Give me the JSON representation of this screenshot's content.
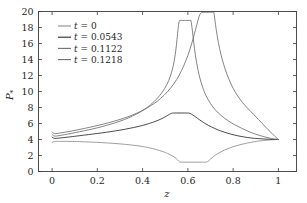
{
  "chart_data": {
    "type": "line",
    "title": "",
    "xlabel": "z",
    "ylabel": "P*",
    "xlim": [
      -0.06,
      1.08
    ],
    "ylim": [
      0,
      20
    ],
    "xticks": [
      "0",
      "0.2",
      "0.4",
      "0.6",
      "0.8",
      "1"
    ],
    "xtick_values": [
      0,
      0.2,
      0.4,
      0.6,
      0.8,
      1.0
    ],
    "yticks": [
      "0",
      "2",
      "4",
      "6",
      "8",
      "10",
      "12",
      "14",
      "16",
      "18",
      "20"
    ],
    "ytick_values": [
      0,
      2,
      4,
      6,
      8,
      10,
      12,
      14,
      16,
      18,
      20
    ],
    "grid": false,
    "legend_position": "upper-left",
    "series": [
      {
        "name": "t = 0",
        "color": "#8c8c8c",
        "points": [
          [
            0.0,
            3.62
          ],
          [
            0.004,
            3.7
          ],
          [
            0.01,
            3.74
          ],
          [
            0.02,
            3.76
          ],
          [
            0.04,
            3.77
          ],
          [
            0.08,
            3.76
          ],
          [
            0.12,
            3.73
          ],
          [
            0.17,
            3.68
          ],
          [
            0.22,
            3.61
          ],
          [
            0.27,
            3.52
          ],
          [
            0.32,
            3.4
          ],
          [
            0.36,
            3.28
          ],
          [
            0.4,
            3.12
          ],
          [
            0.43,
            2.96
          ],
          [
            0.46,
            2.75
          ],
          [
            0.49,
            2.48
          ],
          [
            0.51,
            2.26
          ],
          [
            0.53,
            1.98
          ],
          [
            0.545,
            1.7
          ],
          [
            0.555,
            1.44
          ],
          [
            0.562,
            1.25
          ],
          [
            0.568,
            1.18
          ],
          [
            0.6,
            1.17
          ],
          [
            0.64,
            1.17
          ],
          [
            0.67,
            1.17
          ],
          [
            0.682,
            1.18
          ],
          [
            0.69,
            1.3
          ],
          [
            0.7,
            1.55
          ],
          [
            0.715,
            1.9
          ],
          [
            0.73,
            2.2
          ],
          [
            0.75,
            2.52
          ],
          [
            0.775,
            2.84
          ],
          [
            0.8,
            3.1
          ],
          [
            0.83,
            3.34
          ],
          [
            0.86,
            3.54
          ],
          [
            0.89,
            3.7
          ],
          [
            0.92,
            3.83
          ],
          [
            0.95,
            3.92
          ],
          [
            0.975,
            3.97
          ],
          [
            1.0,
            4.0
          ]
        ]
      },
      {
        "name": "t = 0.0543",
        "color": "#2b2b2b",
        "points": [
          [
            0.0,
            4.3
          ],
          [
            0.005,
            4.2
          ],
          [
            0.012,
            4.14
          ],
          [
            0.025,
            4.16
          ],
          [
            0.045,
            4.22
          ],
          [
            0.07,
            4.3
          ],
          [
            0.1,
            4.4
          ],
          [
            0.14,
            4.54
          ],
          [
            0.18,
            4.68
          ],
          [
            0.22,
            4.83
          ],
          [
            0.26,
            4.99
          ],
          [
            0.3,
            5.17
          ],
          [
            0.34,
            5.38
          ],
          [
            0.38,
            5.62
          ],
          [
            0.415,
            5.88
          ],
          [
            0.445,
            6.15
          ],
          [
            0.47,
            6.42
          ],
          [
            0.49,
            6.68
          ],
          [
            0.505,
            6.92
          ],
          [
            0.518,
            7.14
          ],
          [
            0.528,
            7.27
          ],
          [
            0.535,
            7.31
          ],
          [
            0.57,
            7.31
          ],
          [
            0.6,
            7.31
          ],
          [
            0.605,
            7.3
          ],
          [
            0.615,
            7.18
          ],
          [
            0.628,
            6.95
          ],
          [
            0.642,
            6.66
          ],
          [
            0.66,
            6.3
          ],
          [
            0.68,
            5.94
          ],
          [
            0.705,
            5.56
          ],
          [
            0.73,
            5.24
          ],
          [
            0.76,
            4.93
          ],
          [
            0.79,
            4.67
          ],
          [
            0.82,
            4.47
          ],
          [
            0.85,
            4.31
          ],
          [
            0.88,
            4.19
          ],
          [
            0.91,
            4.11
          ],
          [
            0.945,
            4.05
          ],
          [
            0.975,
            4.01
          ],
          [
            1.0,
            4.0
          ]
        ]
      },
      {
        "name": "t = 0.1122",
        "color": "#6e6e6e",
        "points": [
          [
            0.0,
            4.62
          ],
          [
            0.006,
            4.48
          ],
          [
            0.014,
            4.42
          ],
          [
            0.03,
            4.48
          ],
          [
            0.055,
            4.6
          ],
          [
            0.085,
            4.76
          ],
          [
            0.12,
            4.96
          ],
          [
            0.16,
            5.2
          ],
          [
            0.2,
            5.46
          ],
          [
            0.24,
            5.76
          ],
          [
            0.28,
            6.1
          ],
          [
            0.32,
            6.5
          ],
          [
            0.355,
            6.92
          ],
          [
            0.39,
            7.44
          ],
          [
            0.42,
            8.0
          ],
          [
            0.45,
            8.72
          ],
          [
            0.475,
            9.48
          ],
          [
            0.498,
            10.4
          ],
          [
            0.515,
            11.35
          ],
          [
            0.528,
            12.4
          ],
          [
            0.538,
            13.6
          ],
          [
            0.546,
            15.0
          ],
          [
            0.552,
            16.5
          ],
          [
            0.557,
            17.9
          ],
          [
            0.561,
            18.7
          ],
          [
            0.566,
            18.88
          ],
          [
            0.59,
            18.88
          ],
          [
            0.61,
            18.88
          ],
          [
            0.614,
            18.8
          ],
          [
            0.62,
            17.6
          ],
          [
            0.626,
            16.1
          ],
          [
            0.633,
            14.6
          ],
          [
            0.642,
            13.1
          ],
          [
            0.652,
            11.8
          ],
          [
            0.665,
            10.55
          ],
          [
            0.68,
            9.5
          ],
          [
            0.7,
            8.5
          ],
          [
            0.722,
            7.68
          ],
          [
            0.748,
            6.98
          ],
          [
            0.775,
            6.4
          ],
          [
            0.805,
            5.88
          ],
          [
            0.838,
            5.4
          ],
          [
            0.87,
            4.98
          ],
          [
            0.9,
            4.66
          ],
          [
            0.93,
            4.4
          ],
          [
            0.958,
            4.2
          ],
          [
            0.98,
            4.07
          ],
          [
            1.0,
            4.0
          ]
        ]
      },
      {
        "name": "t = 0.1218",
        "color": "#6e6e6e",
        "points": [
          [
            0.0,
            4.95
          ],
          [
            0.006,
            4.8
          ],
          [
            0.015,
            4.74
          ],
          [
            0.032,
            4.8
          ],
          [
            0.058,
            4.92
          ],
          [
            0.09,
            5.08
          ],
          [
            0.125,
            5.28
          ],
          [
            0.165,
            5.52
          ],
          [
            0.208,
            5.8
          ],
          [
            0.25,
            6.1
          ],
          [
            0.292,
            6.44
          ],
          [
            0.335,
            6.84
          ],
          [
            0.375,
            7.3
          ],
          [
            0.412,
            7.82
          ],
          [
            0.448,
            8.44
          ],
          [
            0.48,
            9.14
          ],
          [
            0.51,
            9.98
          ],
          [
            0.538,
            10.96
          ],
          [
            0.562,
            12.06
          ],
          [
            0.582,
            13.24
          ],
          [
            0.6,
            14.5
          ],
          [
            0.615,
            15.8
          ],
          [
            0.628,
            17.1
          ],
          [
            0.64,
            18.4
          ],
          [
            0.65,
            19.4
          ],
          [
            0.658,
            19.82
          ],
          [
            0.666,
            19.9
          ],
          [
            0.69,
            19.9
          ],
          [
            0.712,
            19.9
          ],
          [
            0.716,
            19.7
          ],
          [
            0.722,
            18.4
          ],
          [
            0.73,
            16.9
          ],
          [
            0.74,
            15.4
          ],
          [
            0.752,
            14.0
          ],
          [
            0.766,
            12.7
          ],
          [
            0.782,
            11.5
          ],
          [
            0.8,
            10.4
          ],
          [
            0.82,
            9.45
          ],
          [
            0.842,
            8.6
          ],
          [
            0.866,
            7.85
          ],
          [
            0.89,
            7.15
          ],
          [
            0.912,
            6.5
          ],
          [
            0.934,
            5.85
          ],
          [
            0.954,
            5.25
          ],
          [
            0.972,
            4.75
          ],
          [
            0.986,
            4.35
          ],
          [
            1.0,
            4.0
          ]
        ]
      }
    ]
  },
  "legend": {
    "entries": [
      {
        "label": "t = 0"
      },
      {
        "label": "t = 0.0543"
      },
      {
        "label": "t = 0.1122"
      },
      {
        "label": "t = 0.1218"
      }
    ]
  },
  "axes": {
    "x_title": "z",
    "y_title_base": "P",
    "y_title_sub": "*"
  }
}
